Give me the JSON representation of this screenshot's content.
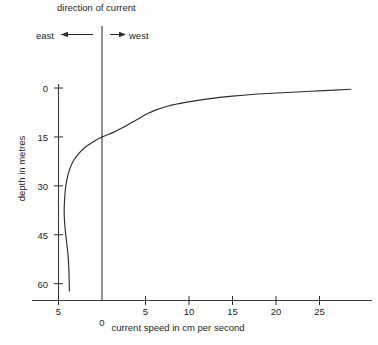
{
  "chart_data": {
    "type": "line",
    "title": "direction of current",
    "xlabel": "current speed in cm per second",
    "ylabel": "depth in metres",
    "xlim": [
      -6.2,
      29.0
    ],
    "ylim": [
      0,
      65
    ],
    "y_inverted": true,
    "grid": false,
    "legend": "none",
    "xticks": [
      -5,
      0,
      5,
      10,
      15,
      20,
      25
    ],
    "xtick_labels": [
      "5",
      "0",
      "5",
      "10",
      "15",
      "20",
      "25"
    ],
    "yticks": [
      0,
      15,
      30,
      45,
      60
    ],
    "ytick_labels": [
      "0",
      "15",
      "30",
      "45",
      "60"
    ],
    "annotations": {
      "east_label": "east",
      "west_label": "west",
      "east_arrow": "left-arrow-icon",
      "west_arrow": "right-arrow-icon",
      "zero_line_x": 0
    },
    "series": [
      {
        "name": "current speed vs depth",
        "x": [
          28.6,
          24.0,
          19.0,
          15.0,
          12.0,
          9.6,
          7.6,
          6.2,
          5.2,
          4.4,
          3.4,
          2.4,
          1.3,
          0.0,
          -1.1,
          -2.0,
          -2.7,
          -3.3,
          -3.7,
          -4.0,
          -4.2,
          -4.3,
          -4.35,
          -4.3,
          -4.2,
          -4.05,
          -3.9,
          -3.8,
          -3.75
        ],
        "y": [
          0.4,
          1.0,
          1.7,
          2.5,
          3.4,
          4.4,
          5.5,
          6.7,
          7.9,
          9.1,
          10.6,
          12.1,
          13.6,
          15.0,
          16.6,
          18.3,
          20.2,
          22.4,
          24.8,
          27.6,
          30.8,
          34.2,
          37.6,
          41.0,
          44.2,
          47.6,
          51.4,
          56.0,
          62.2
        ]
      }
    ],
    "colors": {
      "axis": "#2b2b2b",
      "curve": "#2b2b2b",
      "zero_line": "#2b2b2b",
      "background": "#ffffff",
      "text": "#1d1d1d"
    }
  }
}
